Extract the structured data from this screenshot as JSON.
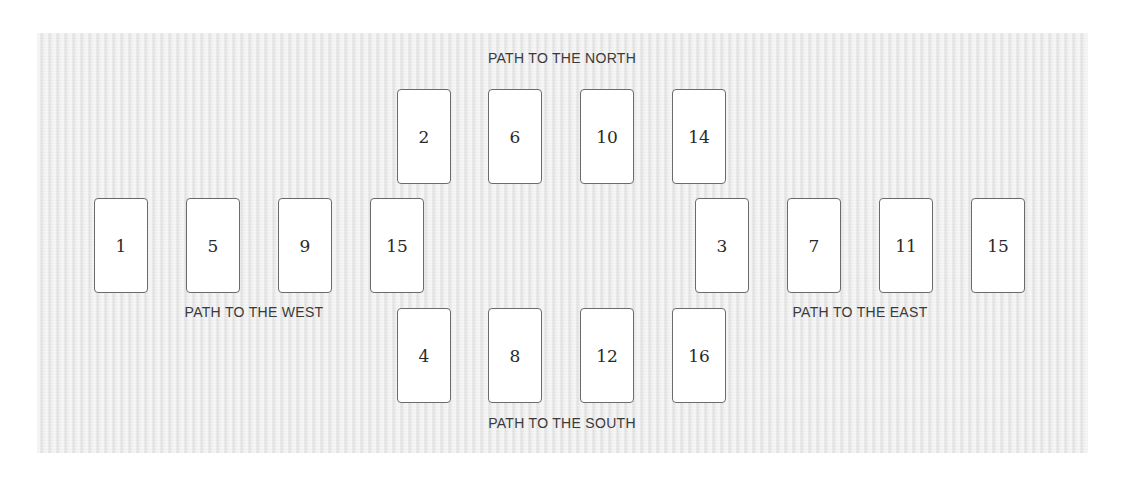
{
  "labels": {
    "north": "PATH TO THE NORTH",
    "west": "PATH TO THE WEST",
    "east": "PATH TO THE EAST",
    "south": "PATH TO THE SOUTH"
  },
  "paths": {
    "north": {
      "cards": [
        "2",
        "6",
        "10",
        "14"
      ]
    },
    "west": {
      "cards": [
        "1",
        "5",
        "9",
        "15"
      ]
    },
    "east": {
      "cards": [
        "3",
        "7",
        "11",
        "15"
      ]
    },
    "south": {
      "cards": [
        "4",
        "8",
        "12",
        "16"
      ]
    }
  },
  "colors": {
    "background": "#e9e9e9",
    "card_fill": "#ffffff",
    "card_border": "#6b6b6b",
    "text": "#2a2a2a"
  }
}
